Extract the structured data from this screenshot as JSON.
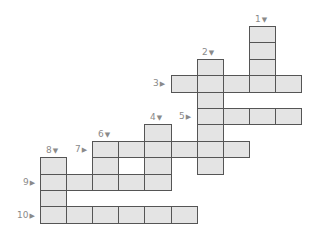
{
  "puzzle": {
    "type": "crossword",
    "grid": {
      "origin_x": 40,
      "origin_y": 26,
      "cell_w": 26.1,
      "cell_h": 16.4,
      "cell_fill": "#e4e4e4",
      "cell_border": "#555555",
      "label_color": "#8a8a8a"
    },
    "clues": [
      {
        "number": "1",
        "direction": "down",
        "arrow": "▼",
        "col": 8,
        "row": 0,
        "length": 4
      },
      {
        "number": "2",
        "direction": "down",
        "arrow": "▼",
        "col": 6,
        "row": 2,
        "length": 7
      },
      {
        "number": "3",
        "direction": "across",
        "arrow": "▶",
        "col": 5,
        "row": 3,
        "length": 5
      },
      {
        "number": "4",
        "direction": "down",
        "arrow": "▼",
        "col": 4,
        "row": 6,
        "length": 4
      },
      {
        "number": "5",
        "direction": "across",
        "arrow": "▶",
        "col": 6,
        "row": 5,
        "length": 4
      },
      {
        "number": "6",
        "direction": "down",
        "arrow": "▼",
        "col": 2,
        "row": 7,
        "length": 3
      },
      {
        "number": "7",
        "direction": "across",
        "arrow": "▶",
        "col": 2,
        "row": 7,
        "length": 6
      },
      {
        "number": "8",
        "direction": "down",
        "arrow": "▼",
        "col": 0,
        "row": 8,
        "length": 4
      },
      {
        "number": "9",
        "direction": "across",
        "arrow": "▶",
        "col": 0,
        "row": 9,
        "length": 5
      },
      {
        "number": "10",
        "direction": "across",
        "arrow": "▶",
        "col": 0,
        "row": 11,
        "length": 6
      }
    ]
  }
}
